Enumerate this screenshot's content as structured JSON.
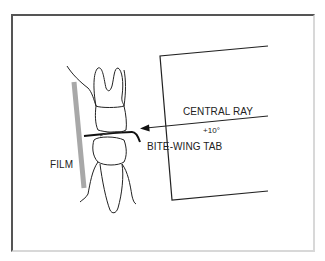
{
  "diagram": {
    "type": "dental bite-wing radiograph technique illustration",
    "labels": {
      "central_ray": "CENTRAL RAY",
      "angle": "+10°",
      "bite_wing_tab": "BITE-WING TAB",
      "film": "FILM"
    },
    "elements": [
      {
        "name": "film",
        "description": "vertical gray bar lingual to teeth"
      },
      {
        "name": "maxillary-molar",
        "description": "upper tooth with two roots"
      },
      {
        "name": "mandibular-tooth",
        "description": "lower tooth with single root"
      },
      {
        "name": "bite-wing-tab",
        "description": "black tab held between occlusal surfaces"
      },
      {
        "name": "x-ray-cone",
        "description": "open rectangular cone outline"
      },
      {
        "name": "central-ray-arrow",
        "description": "arrow pointing toward teeth at +10 degrees"
      }
    ],
    "colors": {
      "line": "#222222",
      "film": "#a8a8a8",
      "frame_dark": "#555555",
      "frame_light": "#d8d8d8"
    }
  }
}
